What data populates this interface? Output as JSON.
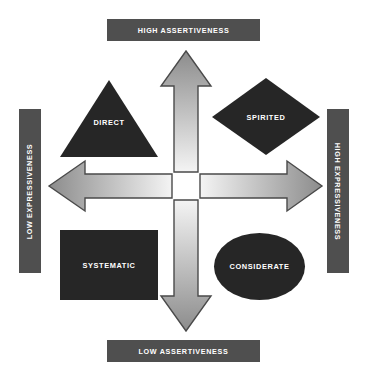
{
  "diagram": {
    "background_color": "#ffffff",
    "shape_fill_color": "#262626",
    "axis_bar_color": "#4f4f4f",
    "axis_label_text_color": "#ffffff",
    "arrow_outline_color": "#3f3f3f"
  },
  "axes": {
    "top": {
      "label": "HIGH ASSERTIVENESS",
      "orientation": "horizontal"
    },
    "bottom": {
      "label": "LOW ASSERTIVENESS",
      "orientation": "horizontal"
    },
    "left": {
      "label": "LOW EXPRESSIVENESS",
      "orientation": "vertical-bottom-to-top"
    },
    "right": {
      "label": "HIGH EXPRESSIVENESS",
      "orientation": "vertical-top-to-bottom"
    }
  },
  "quadrants": [
    {
      "label": "DIRECT",
      "shape": "triangle",
      "position": "top-left",
      "assertiveness": "HIGH ASSERTIVENESS",
      "expressiveness": "LOW EXPRESSIVENESS"
    },
    {
      "label": "SPIRITED",
      "shape": "diamond",
      "position": "top-right",
      "assertiveness": "HIGH ASSERTIVENESS",
      "expressiveness": "HIGH EXPRESSIVENESS"
    },
    {
      "label": "SYSTEMATIC",
      "shape": "rectangle",
      "position": "bottom-left",
      "assertiveness": "LOW ASSERTIVENESS",
      "expressiveness": "LOW EXPRESSIVENESS"
    },
    {
      "label": "CONSIDERATE",
      "shape": "ellipse",
      "position": "bottom-right",
      "assertiveness": "LOW ASSERTIVENESS",
      "expressiveness": "HIGH EXPRESSIVENESS"
    }
  ],
  "arrows": [
    {
      "name": "up-arrow",
      "direction": "up",
      "points_to": "HIGH ASSERTIVENESS",
      "gradient_from": "#8c8c8c",
      "gradient_to": "#f2f2f2"
    },
    {
      "name": "down-arrow",
      "direction": "down",
      "points_to": "LOW ASSERTIVENESS",
      "gradient_from": "#f2f2f2",
      "gradient_to": "#8c8c8c"
    },
    {
      "name": "left-arrow",
      "direction": "left",
      "points_to": "LOW EXPRESSIVENESS",
      "gradient_from": "#8c8c8c",
      "gradient_to": "#f2f2f2"
    },
    {
      "name": "right-arrow",
      "direction": "right",
      "points_to": "HIGH EXPRESSIVENESS",
      "gradient_from": "#f2f2f2",
      "gradient_to": "#8c8c8c"
    }
  ]
}
